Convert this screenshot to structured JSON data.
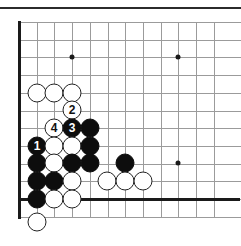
{
  "figure": {
    "type": "go-board-diagram",
    "board_size": 19,
    "region": "bottom-left corner",
    "colors": {
      "board_background": "#ffffff",
      "grid_line": "#9b9b9b",
      "board_edge": "#1a1a1a",
      "black_stone": "#0d0d0d",
      "white_stone": "#ffffff",
      "white_stone_outline": "#222222",
      "black_label_text": "#ffffff",
      "white_label_text": "#111111",
      "top_rule": "#2b2b2b"
    }
  },
  "grid": {
    "spacing_px": 17.7,
    "origin_x": 19,
    "origin_y": 13,
    "columns": 12,
    "rows": 12,
    "star_points": [
      {
        "col": 3,
        "row": 2,
        "x": 72,
        "y": 57
      },
      {
        "col": 9,
        "row": 2,
        "x": 178,
        "y": 57
      },
      {
        "col": 9,
        "row": 8,
        "x": 178,
        "y": 163
      }
    ]
  },
  "stones": [
    {
      "id": "w-a",
      "color": "white",
      "label": "",
      "x": 37,
      "y": 93
    },
    {
      "id": "w-b",
      "color": "white",
      "label": "",
      "x": 54,
      "y": 93
    },
    {
      "id": "w-c",
      "color": "white",
      "label": "",
      "x": 72,
      "y": 93
    },
    {
      "id": "move-2",
      "color": "white",
      "label": "2",
      "x": 72,
      "y": 110
    },
    {
      "id": "move-4",
      "color": "white",
      "label": "4",
      "x": 54,
      "y": 128
    },
    {
      "id": "move-3",
      "color": "black",
      "label": "3",
      "x": 72,
      "y": 128
    },
    {
      "id": "b-d",
      "color": "black",
      "label": "",
      "x": 90,
      "y": 128
    },
    {
      "id": "move-1",
      "color": "black",
      "label": "1",
      "x": 37,
      "y": 146
    },
    {
      "id": "w-e",
      "color": "white",
      "label": "",
      "x": 54,
      "y": 146
    },
    {
      "id": "w-f",
      "color": "white",
      "label": "",
      "x": 72,
      "y": 146
    },
    {
      "id": "b-g",
      "color": "black",
      "label": "",
      "x": 90,
      "y": 146
    },
    {
      "id": "b-h",
      "color": "black",
      "label": "",
      "x": 37,
      "y": 163
    },
    {
      "id": "w-i",
      "color": "white",
      "label": "",
      "x": 54,
      "y": 163
    },
    {
      "id": "b-j",
      "color": "black",
      "label": "",
      "x": 72,
      "y": 163
    },
    {
      "id": "b-k",
      "color": "black",
      "label": "",
      "x": 90,
      "y": 163
    },
    {
      "id": "b-l",
      "color": "black",
      "label": "",
      "x": 125,
      "y": 163
    },
    {
      "id": "b-m",
      "color": "black",
      "label": "",
      "x": 37,
      "y": 181
    },
    {
      "id": "b-n",
      "color": "black",
      "label": "",
      "x": 54,
      "y": 181
    },
    {
      "id": "w-o",
      "color": "white",
      "label": "",
      "x": 72,
      "y": 181
    },
    {
      "id": "w-p",
      "color": "white",
      "label": "",
      "x": 107,
      "y": 181
    },
    {
      "id": "w-q",
      "color": "white",
      "label": "",
      "x": 125,
      "y": 181
    },
    {
      "id": "w-r",
      "color": "white",
      "label": "",
      "x": 143,
      "y": 181
    },
    {
      "id": "b-s",
      "color": "black",
      "label": "",
      "x": 37,
      "y": 199
    },
    {
      "id": "w-t",
      "color": "white",
      "label": "",
      "x": 54,
      "y": 199
    },
    {
      "id": "w-u",
      "color": "white",
      "label": "",
      "x": 72,
      "y": 199
    },
    {
      "id": "w-captured",
      "color": "white",
      "label": "",
      "x": 37,
      "y": 222
    }
  ]
}
